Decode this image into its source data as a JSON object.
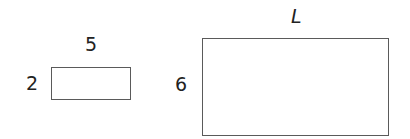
{
  "diagram": {
    "type": "similar-rectangles",
    "shapes": [
      {
        "name": "small-rectangle",
        "width_label": "5",
        "height_label": "2"
      },
      {
        "name": "large-rectangle",
        "width_label": "L",
        "height_label": "6"
      }
    ],
    "colors": {
      "stroke": "#5a5a5a",
      "text": "#222222",
      "background": "#ffffff"
    }
  }
}
